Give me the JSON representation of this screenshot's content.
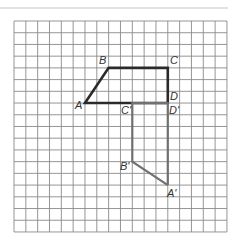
{
  "diagram": {
    "type": "grid-transformation",
    "grid": {
      "columns": 18,
      "rows": 18
    },
    "colors": {
      "grid": "#8a8a8a",
      "original": "#2a2a2a",
      "image": "#707070",
      "rule": "#e2e2e2"
    },
    "original": {
      "name": "ABCD",
      "vertices": [
        {
          "label": "A",
          "x": 6,
          "y": 7
        },
        {
          "label": "B",
          "x": 8,
          "y": 4
        },
        {
          "label": "C",
          "x": 13,
          "y": 4
        },
        {
          "label": "D",
          "x": 13,
          "y": 7
        }
      ]
    },
    "image": {
      "name": "A'B'C'D'",
      "vertices": [
        {
          "label": "A'",
          "x": 13,
          "y": 14
        },
        {
          "label": "B'",
          "x": 10,
          "y": 12
        },
        {
          "label": "C'",
          "x": 10,
          "y": 7
        },
        {
          "label": "D'",
          "x": 13,
          "y": 7
        }
      ]
    }
  }
}
